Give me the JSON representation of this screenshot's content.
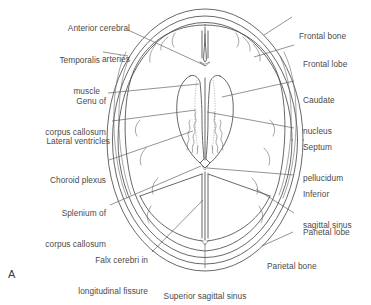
{
  "figure": {
    "panel_letter": "A",
    "view": "axial brain section",
    "line_color": "#4d4d4d",
    "text_color": "#4a4a4a",
    "background_color": "#ffffff"
  },
  "labels_left": [
    {
      "id": "anterior-cerebral-arteries",
      "lines": [
        "Anterior cerebral",
        "arteries"
      ]
    },
    {
      "id": "temporalis-muscle",
      "lines": [
        "Temporalis",
        "muscle"
      ]
    },
    {
      "id": "genu-of-corpus-callosum",
      "lines": [
        "Genu of",
        "corpus callosum"
      ]
    },
    {
      "id": "lateral-ventricles",
      "lines": [
        "Lateral ventricles"
      ]
    },
    {
      "id": "choroid-plexus",
      "lines": [
        "Choroid plexus"
      ]
    },
    {
      "id": "splenium-of-corpus-callosum",
      "lines": [
        "Splenium of",
        "corpus callosum"
      ]
    },
    {
      "id": "falx-cerebri",
      "lines": [
        "Falx cerebri in",
        "longitudinal fissure"
      ]
    }
  ],
  "labels_right": [
    {
      "id": "frontal-bone",
      "lines": [
        "Frontal bone"
      ]
    },
    {
      "id": "frontal-lobe",
      "lines": [
        "Frontal lobe"
      ]
    },
    {
      "id": "caudate-nucleus",
      "lines": [
        "Caudate",
        "nucleus"
      ]
    },
    {
      "id": "septum-pellucidum",
      "lines": [
        "Septum",
        "pellucidum"
      ]
    },
    {
      "id": "inferior-sagittal-sinus",
      "lines": [
        "Inferior",
        "sagittal sinus"
      ]
    },
    {
      "id": "parietal-lobe",
      "lines": [
        "Parietal lobe"
      ]
    },
    {
      "id": "parietal-bone",
      "lines": [
        "Parietal bone"
      ]
    }
  ],
  "labels_bottom": [
    {
      "id": "superior-sagittal-sinus",
      "lines": [
        "Superior sagittal sinus"
      ]
    }
  ]
}
